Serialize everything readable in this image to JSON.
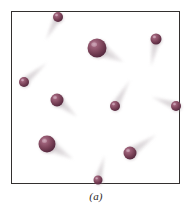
{
  "figure": {
    "caption": "(a)",
    "alt_label": "gas-molecules-in-container",
    "box": {
      "x": 11,
      "y": 11,
      "width": 169,
      "height": 173,
      "border_color": "#33302f",
      "fill_color": "#ffffff",
      "border_width": 1.4
    },
    "colors": {
      "sphere_base": "#7a4258",
      "sphere_dark": "#4a2234",
      "sphere_highlight": "#c79bae",
      "trail": "#d8d3d6",
      "caption_text": "#2b2827",
      "background": "#ffffff"
    }
  },
  "chart_data": {
    "type": "scatter",
    "title": "(a)",
    "xlabel": "",
    "ylabel": "",
    "xlim": [
      11,
      180
    ],
    "ylim": [
      11,
      184
    ],
    "grid": false,
    "legend": null,
    "particles": [
      {
        "id": 1,
        "cx": 58,
        "cy": 17,
        "r": 5.0,
        "trail_angle": 118,
        "trail_len": 26
      },
      {
        "id": 2,
        "cx": 97,
        "cy": 48,
        "r": 9.5,
        "trail_angle": 28,
        "trail_len": 30
      },
      {
        "id": 3,
        "cx": 156,
        "cy": 39,
        "r": 5.5,
        "trail_angle": 100,
        "trail_len": 28
      },
      {
        "id": 4,
        "cx": 24,
        "cy": 82,
        "r": 5.0,
        "trail_angle": -40,
        "trail_len": 30
      },
      {
        "id": 5,
        "cx": 57,
        "cy": 100,
        "r": 6.5,
        "trail_angle": 40,
        "trail_len": 26
      },
      {
        "id": 6,
        "cx": 115,
        "cy": 106,
        "r": 5.0,
        "trail_angle": -60,
        "trail_len": 30
      },
      {
        "id": 7,
        "cx": 176,
        "cy": 106,
        "r": 5.0,
        "trail_angle": 200,
        "trail_len": 26
      },
      {
        "id": 8,
        "cx": 47,
        "cy": 144,
        "r": 8.5,
        "trail_angle": 30,
        "trail_len": 30
      },
      {
        "id": 9,
        "cx": 130,
        "cy": 153,
        "r": 6.5,
        "trail_angle": -35,
        "trail_len": 32
      },
      {
        "id": 10,
        "cx": 98,
        "cy": 180,
        "r": 4.5,
        "trail_angle": -75,
        "trail_len": 26
      }
    ]
  }
}
